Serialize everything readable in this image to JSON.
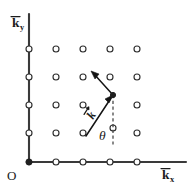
{
  "figure": {
    "background_color": "#ffffff",
    "ink_color": "#1b1b1b",
    "axis_color": "#3a3a3a",
    "width": 189,
    "height": 188
  },
  "axes": {
    "x_axis": {
      "label_base": "k",
      "label_sub": "x",
      "has_overbar": true,
      "label_full": "k̄x",
      "label_x": 162,
      "label_y": 176
    },
    "y_axis": {
      "label_base": "k",
      "label_sub": "y",
      "has_overbar": true,
      "label_full": "k̄y",
      "label_x": 14,
      "label_y": 24
    },
    "origin": {
      "label": "O",
      "label_x": 9,
      "label_y": 178,
      "point_x": 29,
      "point_y": 162
    },
    "x_line": {
      "x1": 29,
      "y1": 162,
      "x2": 186,
      "y2": 162
    },
    "y_line": {
      "x1": 29,
      "y1": 162,
      "x2": 29,
      "y2": 14
    }
  },
  "lattice": {
    "description": "Square array of reciprocal-lattice points (open circles)",
    "radius": 3.0,
    "columns_x": [
      29,
      50,
      71,
      92,
      113,
      134
    ],
    "rows_y": [
      162,
      134,
      106,
      77,
      49
    ],
    "points": [
      {
        "x": 29,
        "y": 49,
        "filled": false
      },
      {
        "x": 56,
        "y": 49,
        "filled": false
      },
      {
        "x": 83,
        "y": 49,
        "filled": false
      },
      {
        "x": 110,
        "y": 49,
        "filled": false
      },
      {
        "x": 137,
        "y": 49,
        "filled": false
      },
      {
        "x": 29,
        "y": 77,
        "filled": false
      },
      {
        "x": 56,
        "y": 77,
        "filled": false
      },
      {
        "x": 83,
        "y": 77,
        "filled": false
      },
      {
        "x": 110,
        "y": 77,
        "filled": false
      },
      {
        "x": 137,
        "y": 77,
        "filled": false
      },
      {
        "x": 29,
        "y": 105,
        "filled": false
      },
      {
        "x": 56,
        "y": 105,
        "filled": false
      },
      {
        "x": 83,
        "y": 105,
        "filled": false
      },
      {
        "x": 113,
        "y": 95,
        "filled": true
      },
      {
        "x": 137,
        "y": 105,
        "filled": false
      },
      {
        "x": 29,
        "y": 133,
        "filled": false
      },
      {
        "x": 56,
        "y": 133,
        "filled": false
      },
      {
        "x": 83,
        "y": 133,
        "filled": false
      },
      {
        "x": 113,
        "y": 128,
        "filled": false
      },
      {
        "x": 137,
        "y": 133,
        "filled": false
      },
      {
        "x": 29,
        "y": 162,
        "filled": true
      },
      {
        "x": 56,
        "y": 162,
        "filled": false
      },
      {
        "x": 83,
        "y": 162,
        "filled": false
      },
      {
        "x": 110,
        "y": 162,
        "filled": false
      },
      {
        "x": 137,
        "y": 162,
        "filled": false
      }
    ]
  },
  "annotations": {
    "wave_vector": {
      "label": "k",
      "has_vector_arrow": true,
      "label_full": "k⃗",
      "label_x": 93,
      "label_y": 119,
      "label_rotation_deg": -58,
      "tail_x": 88,
      "tail_y": 133,
      "head_x": 112,
      "head_y": 97
    },
    "scattered_vector": {
      "label": "",
      "tail_x": 113,
      "tail_y": 95,
      "head_x": 92,
      "head_y": 72
    },
    "angle": {
      "label": "θ",
      "label_x": 101,
      "label_y": 139,
      "reference_line": {
        "x1": 113,
        "y1": 95,
        "x2": 113,
        "y2": 146,
        "style": "dashed",
        "orientation": "vertical"
      }
    }
  }
}
